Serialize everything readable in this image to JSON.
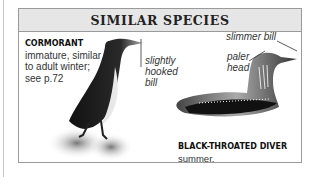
{
  "panel": {
    "title": "SIMILAR SPECIES"
  },
  "species": [
    {
      "name": "CORMORANT",
      "lines": [
        "immature, similar",
        "to adult winter;",
        "see p.72"
      ],
      "annotations": [
        {
          "label_lines": [
            "slightly",
            "hooked",
            "bill"
          ]
        }
      ]
    },
    {
      "name": "BLACK-THROATED DIVER",
      "name_suffix": " summer,",
      "line2": "similar to adult summer; see p.57",
      "annotations": [
        {
          "label": "slimmer bill"
        },
        {
          "label_lines": [
            "paler",
            "head"
          ]
        }
      ]
    }
  ],
  "colors": {
    "header_bg": "#e6e6e6",
    "border": "#9a9a9a",
    "text": "#333333"
  }
}
